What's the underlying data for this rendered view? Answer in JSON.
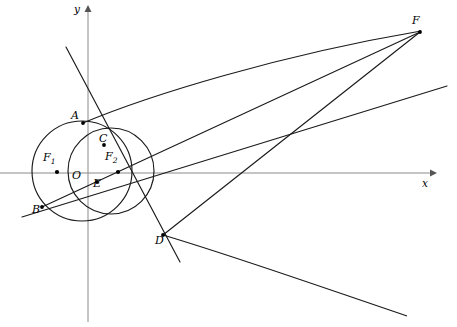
{
  "figure": {
    "width": 457,
    "height": 327,
    "background": "#ffffff",
    "stroke_color": "#1a1a1a",
    "axis_color": "#808080"
  },
  "axes": {
    "x_label": "x",
    "y_label": "y",
    "origin_label": "O",
    "x_axis": {
      "x1": 0,
      "y1": 173,
      "x2": 432,
      "y2": 173
    },
    "y_axis": {
      "x1": 88,
      "y1": 320,
      "x2": 88,
      "y2": 9
    },
    "x_label_pos": {
      "x": 423,
      "y": 178
    },
    "y_label_pos": {
      "x": 75,
      "y": 3
    },
    "origin_label_pos": {
      "x": 74,
      "y": 172
    }
  },
  "points": [
    {
      "name": "A",
      "label": "A",
      "x": 83,
      "y": 123,
      "label_x": 72,
      "label_y": 112
    },
    {
      "name": "B",
      "label": "B",
      "x": 42,
      "y": 207,
      "label_x": 33,
      "label_y": 206
    },
    {
      "name": "C",
      "label": "C",
      "x": 104,
      "y": 145,
      "label_x": 100,
      "label_y": 135
    },
    {
      "name": "D",
      "label": "D",
      "x": 163,
      "y": 235,
      "label_x": 157,
      "label_y": 236
    },
    {
      "name": "E",
      "label": "E",
      "x": 97,
      "y": 182,
      "label_x": 94,
      "label_y": 180
    },
    {
      "name": "F",
      "label": "F",
      "x": 420,
      "y": 32,
      "label_x": 414,
      "label_y": 17
    },
    {
      "name": "O",
      "label": "O",
      "x": 88,
      "y": 173,
      "label_x": 74,
      "label_y": 172
    },
    {
      "name": "F1",
      "label": "F",
      "sub": "1",
      "x": 57,
      "y": 172,
      "label_x": 44,
      "label_y": 153
    },
    {
      "name": "F2",
      "label": "F",
      "sub": "2",
      "x": 118,
      "y": 172,
      "label_x": 106,
      "label_y": 152
    }
  ],
  "circles": [
    {
      "name": "large-circle",
      "cx": 82,
      "cy": 171,
      "r": 50
    },
    {
      "name": "small-circle",
      "cx": 111,
      "cy": 171,
      "r": 43
    }
  ],
  "segments": [
    {
      "name": "segment-A-F",
      "from": "A",
      "to": "F"
    },
    {
      "name": "segment-B-F",
      "from": "B",
      "to": "F"
    },
    {
      "name": "segment-D-F",
      "from": "D",
      "to": "F"
    },
    {
      "name": "line-A-to-D-extended",
      "from": "A",
      "to": "D"
    },
    {
      "name": "line-B-to-C-extended",
      "from": "B",
      "to": "C"
    }
  ],
  "curves": [
    {
      "name": "parabola-branch-upper",
      "description": "curve from A rising to F"
    },
    {
      "name": "parabola-branch-lower",
      "description": "curve from D falling to lower right"
    }
  ],
  "marked_dots": [
    "A",
    "B",
    "C",
    "D",
    "E",
    "F",
    "F1",
    "F2"
  ]
}
